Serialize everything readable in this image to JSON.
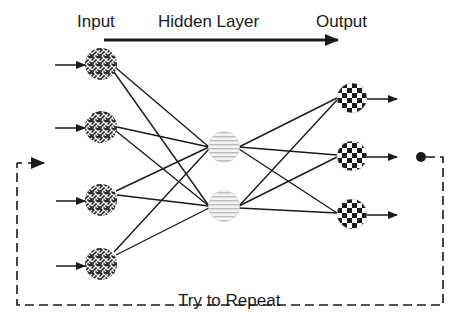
{
  "diagram": {
    "title_labels": {
      "input": "Input",
      "hidden": "Hidden Layer",
      "output": "Output"
    },
    "feedback_label": "Try to Repeat",
    "colors": {
      "line": "#1a1a1a",
      "background": "#ffffff",
      "hidden_node_fill": "#e8e8e8"
    },
    "layers": {
      "input": {
        "count": 4,
        "pattern": "woven-crosshatch-icon"
      },
      "hidden": {
        "count": 2,
        "pattern": "horizontal-stripes-icon"
      },
      "output": {
        "count": 3,
        "pattern": "checkerboard-icon"
      }
    },
    "connections": "fully-connected",
    "flow_arrow": "left-to-right",
    "feedback_loop": "dashed, from output back to input"
  }
}
